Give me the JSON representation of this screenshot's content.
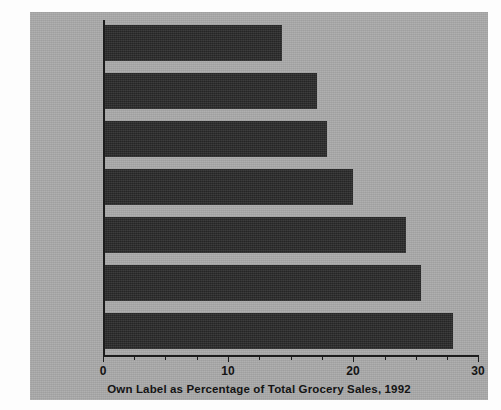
{
  "figure": {
    "background_color": "#fdfdfd",
    "panel_color": "#a9a9a9",
    "bar_color": "#2c2c2c",
    "axis_color": "#1c1c1c"
  },
  "chart_data": {
    "type": "bar",
    "orientation": "horizontal",
    "title": "",
    "xlabel": "Own Label as Percentage of Total Grocery Sales, 1992",
    "ylabel": "",
    "categories": [
      "United States",
      "Holland",
      "Belgium",
      "France",
      "Germany",
      "Switzerland",
      "Great Britain"
    ],
    "values": [
      14.3,
      17.1,
      17.9,
      20.0,
      24.2,
      25.4,
      28.0
    ],
    "xlim": [
      0,
      30
    ],
    "xticks": [
      0,
      10,
      20,
      30
    ],
    "xtick_labels": [
      "0",
      "10",
      "20",
      "30"
    ],
    "minor_tick_step": 2.5,
    "grid": false,
    "legend": null
  },
  "axis": {
    "tick_labels": [
      "0",
      "10",
      "20",
      "30"
    ],
    "caption": "Own Label as Percentage of Total Grocery Sales, 1992"
  },
  "bars": [
    {
      "label": "United States",
      "value": 14.3
    },
    {
      "label": "Holland",
      "value": 17.1
    },
    {
      "label": "Belgium",
      "value": 17.9
    },
    {
      "label": "France",
      "value": 20.0
    },
    {
      "label": "Germany",
      "value": 24.2
    },
    {
      "label": "Switzerland",
      "value": 25.4
    },
    {
      "label": "Great Britain",
      "value": 28.0
    }
  ]
}
